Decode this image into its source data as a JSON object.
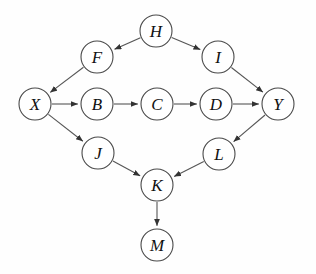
{
  "diagram": {
    "type": "node-link-diagram",
    "node_radius": 16,
    "colors": {
      "node_fill": "#ffffff",
      "node_stroke": "#4a4a4a",
      "edge_stroke": "#555555",
      "label_color": "#111111",
      "background": "#fefefe"
    },
    "nodes": [
      {
        "id": "H",
        "label": "H",
        "x": 156,
        "y": 31
      },
      {
        "id": "F",
        "label": "F",
        "x": 97,
        "y": 57
      },
      {
        "id": "I",
        "label": "I",
        "x": 218,
        "y": 57
      },
      {
        "id": "X",
        "label": "X",
        "x": 35,
        "y": 104
      },
      {
        "id": "B",
        "label": "B",
        "x": 97,
        "y": 104
      },
      {
        "id": "C",
        "label": "C",
        "x": 157,
        "y": 104
      },
      {
        "id": "D",
        "label": "D",
        "x": 216,
        "y": 104
      },
      {
        "id": "Y",
        "label": "Y",
        "x": 278,
        "y": 104
      },
      {
        "id": "J",
        "label": "J",
        "x": 98,
        "y": 153
      },
      {
        "id": "L",
        "label": "L",
        "x": 219,
        "y": 154
      },
      {
        "id": "K",
        "label": "K",
        "x": 157,
        "y": 185
      },
      {
        "id": "M",
        "label": "M",
        "x": 157,
        "y": 245
      }
    ],
    "edges": [
      {
        "from": "H",
        "to": "F"
      },
      {
        "from": "H",
        "to": "I"
      },
      {
        "from": "F",
        "to": "X"
      },
      {
        "from": "I",
        "to": "Y"
      },
      {
        "from": "X",
        "to": "B"
      },
      {
        "from": "B",
        "to": "C"
      },
      {
        "from": "C",
        "to": "D"
      },
      {
        "from": "D",
        "to": "Y"
      },
      {
        "from": "X",
        "to": "J"
      },
      {
        "from": "Y",
        "to": "L"
      },
      {
        "from": "J",
        "to": "K"
      },
      {
        "from": "L",
        "to": "K"
      },
      {
        "from": "K",
        "to": "M"
      }
    ]
  }
}
